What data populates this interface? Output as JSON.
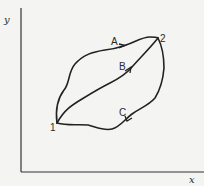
{
  "diagram": {
    "axes": {
      "x_label": "x",
      "y_label": "y"
    },
    "states": [
      {
        "id": "1",
        "label": "1"
      },
      {
        "id": "2",
        "label": "2"
      }
    ],
    "paths": [
      {
        "id": "A",
        "label": "A",
        "from": "1",
        "to": "2",
        "direction": "1 to 2 (upper curve)"
      },
      {
        "id": "B",
        "label": "B",
        "from": "1",
        "to": "2",
        "direction": "1 to 2 (middle curve)"
      },
      {
        "id": "C",
        "label": "C",
        "from": "2",
        "to": "1",
        "direction": "2 to 1 (lower curve)"
      }
    ],
    "colors": {
      "line": "#222222",
      "background": "#f4f4f2"
    }
  }
}
